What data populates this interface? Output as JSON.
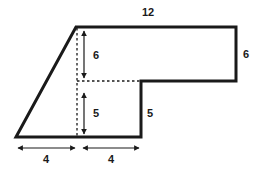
{
  "figure": {
    "shape_kind": "composite L-shaped polygon with slanted left side",
    "colors": {
      "background": "#ffffff",
      "outline": "#1a1a1a",
      "dashed_guide": "#1a1a1a",
      "dimension_arrow": "#1a1a1a",
      "label_text": "#1a1a1a"
    },
    "outline_vertices": [
      {
        "name": "bottom-left",
        "x": 16,
        "y": 137
      },
      {
        "name": "apex-top-left",
        "x": 76,
        "y": 27
      },
      {
        "name": "top-right",
        "x": 236,
        "y": 27
      },
      {
        "name": "right-bottom",
        "x": 236,
        "y": 81
      },
      {
        "name": "notch-inner-top",
        "x": 141,
        "y": 81
      },
      {
        "name": "notch-inner-bottom",
        "x": 141,
        "y": 137
      }
    ],
    "labels": [
      {
        "id": "top",
        "text": "12",
        "x": 148,
        "y": 16,
        "anchor": "middle",
        "describes": "top horizontal edge length"
      },
      {
        "id": "right",
        "text": "6",
        "x": 243,
        "y": 58,
        "anchor": "start",
        "describes": "right vertical edge length"
      },
      {
        "id": "upper-height",
        "text": "6",
        "x": 93,
        "y": 59,
        "anchor": "start",
        "describes": "upper interior vertical height"
      },
      {
        "id": "lower-height",
        "text": "5",
        "x": 93,
        "y": 117,
        "anchor": "start",
        "describes": "lower interior vertical height"
      },
      {
        "id": "notch",
        "text": "5",
        "x": 147,
        "y": 117,
        "anchor": "start",
        "describes": "inner vertical notch edge length"
      },
      {
        "id": "base-left",
        "text": "4",
        "x": 46,
        "y": 163,
        "anchor": "middle",
        "describes": "left base segment length"
      },
      {
        "id": "base-right",
        "text": "4",
        "x": 111,
        "y": 163,
        "anchor": "middle",
        "describes": "right base segment length"
      }
    ],
    "dashed_guides": [
      {
        "id": "vertical-guide",
        "x1": 77,
        "y1": 28,
        "x2": 77,
        "y2": 137
      },
      {
        "id": "horizontal-guide",
        "x1": 77,
        "y1": 81,
        "x2": 141,
        "y2": 81
      }
    ],
    "dimension_arrows": [
      {
        "id": "arrow-upper-6",
        "orientation": "vertical",
        "x1": 84,
        "y1": 31,
        "x2": 84,
        "y2": 78
      },
      {
        "id": "arrow-lower-5",
        "orientation": "vertical",
        "x1": 84,
        "y1": 93,
        "x2": 84,
        "y2": 134
      },
      {
        "id": "arrow-base-left-4",
        "orientation": "horizontal",
        "x1": 17,
        "y1": 148,
        "x2": 76,
        "y2": 148
      },
      {
        "id": "arrow-base-right-4",
        "orientation": "horizontal",
        "x1": 82,
        "y1": 148,
        "x2": 140,
        "y2": 148
      }
    ]
  }
}
